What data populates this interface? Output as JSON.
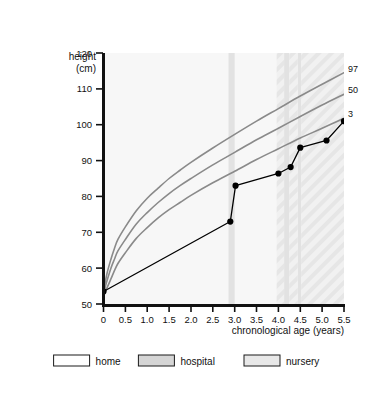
{
  "chart_data": {
    "type": "line",
    "title": "",
    "xlabel": "chronological age (years)",
    "ylabel": "height (cm)",
    "ylabel_line1": "height",
    "ylabel_line2": "(cm)",
    "xlim": [
      0,
      5.5
    ],
    "ylim": [
      50,
      120
    ],
    "xticks": [
      "0",
      "0.5",
      "1.0",
      "1.5",
      "2.0",
      "2.5",
      "3.0",
      "3.5",
      "4.0",
      "4.5",
      "5.0",
      "5.5"
    ],
    "xtick_values": [
      0,
      0.5,
      1.0,
      1.5,
      2.0,
      2.5,
      3.0,
      3.5,
      4.0,
      4.5,
      5.0,
      5.5
    ],
    "yticks": [
      "50",
      "60",
      "70",
      "80",
      "90",
      "100",
      "110",
      "120"
    ],
    "ytick_values": [
      50,
      60,
      70,
      80,
      90,
      100,
      110,
      120
    ],
    "grid": false,
    "legend_position": "bottom",
    "series": [
      {
        "name": "97",
        "label": "97",
        "kind": "percentile-curve",
        "color": "#8a8a8a",
        "points": [
          [
            0.0,
            53.5
          ],
          [
            0.08,
            58.5
          ],
          [
            0.17,
            62.5
          ],
          [
            0.25,
            65.5
          ],
          [
            0.33,
            68.0
          ],
          [
            0.5,
            71.5
          ],
          [
            0.75,
            76.0
          ],
          [
            1.0,
            79.5
          ],
          [
            1.25,
            82.3
          ],
          [
            1.5,
            85.0
          ],
          [
            1.75,
            87.3
          ],
          [
            2.0,
            89.5
          ],
          [
            2.5,
            93.5
          ],
          [
            3.0,
            97.3
          ],
          [
            3.5,
            101.0
          ],
          [
            4.0,
            104.5
          ],
          [
            4.5,
            108.0
          ],
          [
            5.0,
            111.3
          ],
          [
            5.5,
            114.5
          ]
        ]
      },
      {
        "name": "50",
        "label": "50",
        "kind": "percentile-curve",
        "color": "#8a8a8a",
        "points": [
          [
            0.0,
            53.0
          ],
          [
            0.08,
            56.5
          ],
          [
            0.17,
            60.0
          ],
          [
            0.25,
            62.5
          ],
          [
            0.33,
            64.8
          ],
          [
            0.5,
            68.0
          ],
          [
            0.75,
            72.3
          ],
          [
            1.0,
            75.5
          ],
          [
            1.25,
            78.3
          ],
          [
            1.5,
            80.8
          ],
          [
            1.75,
            83.0
          ],
          [
            2.0,
            85.0
          ],
          [
            2.5,
            88.8
          ],
          [
            3.0,
            92.3
          ],
          [
            3.5,
            95.8
          ],
          [
            4.0,
            99.0
          ],
          [
            4.5,
            102.3
          ],
          [
            5.0,
            105.5
          ],
          [
            5.5,
            108.5
          ]
        ]
      },
      {
        "name": "3",
        "label": "3",
        "kind": "percentile-curve",
        "color": "#8a8a8a",
        "points": [
          [
            0.0,
            52.5
          ],
          [
            0.08,
            54.5
          ],
          [
            0.17,
            57.0
          ],
          [
            0.25,
            59.3
          ],
          [
            0.33,
            61.3
          ],
          [
            0.5,
            64.3
          ],
          [
            0.75,
            68.3
          ],
          [
            1.0,
            71.3
          ],
          [
            1.25,
            74.0
          ],
          [
            1.5,
            76.3
          ],
          [
            1.75,
            78.3
          ],
          [
            2.0,
            80.3
          ],
          [
            2.5,
            83.8
          ],
          [
            3.0,
            87.0
          ],
          [
            3.5,
            90.3
          ],
          [
            4.0,
            93.3
          ],
          [
            4.5,
            96.3
          ],
          [
            5.0,
            99.0
          ],
          [
            5.5,
            101.8
          ]
        ]
      },
      {
        "name": "patient",
        "label": "",
        "kind": "measurements",
        "color": "#000000",
        "points": [
          [
            0.0,
            53.5
          ],
          [
            2.9,
            73.0
          ],
          [
            3.02,
            83.0
          ],
          [
            4.0,
            86.4
          ],
          [
            4.28,
            88.2
          ],
          [
            4.5,
            93.6
          ],
          [
            5.1,
            95.6
          ],
          [
            5.5,
            101.0
          ]
        ]
      }
    ],
    "bands": [
      {
        "name": "hospital",
        "x0": 2.86,
        "x1": 3.0,
        "fill": "#e2e2e2"
      },
      {
        "name": "hospital",
        "x0": 4.13,
        "x1": 4.25,
        "fill": "#e2e2e2"
      },
      {
        "name": "hospital",
        "x0": 4.44,
        "x1": 4.52,
        "fill": "#e2e2e2"
      },
      {
        "name": "nursery",
        "x0": 3.96,
        "x1": 4.13,
        "fill": "#f0f0f0"
      },
      {
        "name": "nursery",
        "x0": 4.25,
        "x1": 4.44,
        "fill": "#f0f0f0"
      },
      {
        "name": "nursery",
        "x0": 4.52,
        "x1": 5.5,
        "fill": "#f0f0f0"
      }
    ]
  },
  "legend": {
    "items": [
      {
        "label": "home",
        "swatch_fill": "#ffffff",
        "swatch_stroke": "#1a1a1a"
      },
      {
        "label": "hospital",
        "swatch_fill": "#d5d5d5",
        "swatch_stroke": "#1a1a1a"
      },
      {
        "label": "nursery",
        "swatch_fill": "#e8e8e8",
        "swatch_stroke": "#1a1a1a"
      }
    ]
  },
  "colors": {
    "background": "#ffffff",
    "plot_background": "#f7f7f7",
    "axis": "#111111",
    "percentile_curve": "#8a8a8a",
    "patient_line": "#000000",
    "band_hospital": "#e2e2e2",
    "band_nursery": "#f0f0f0"
  }
}
